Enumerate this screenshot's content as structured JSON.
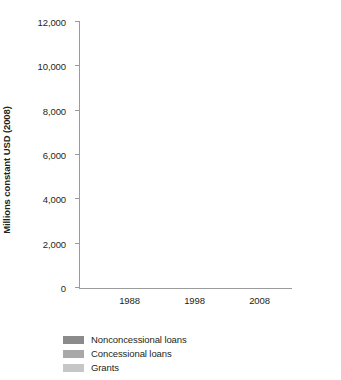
{
  "chart_data": {
    "type": "bar",
    "subtype": "stacked-vertical",
    "title": "",
    "xlabel": "",
    "ylabel": "Millions constant USD (2008)",
    "categories": [
      "1988",
      "1998",
      "2008"
    ],
    "ylim": [
      0,
      12000
    ],
    "yticks": [
      0,
      2000,
      4000,
      6000,
      8000,
      10000,
      12000
    ],
    "ytick_labels": [
      "0",
      "2,000",
      "4,000",
      "6,000",
      "8,000",
      "10,000",
      "12,000"
    ],
    "grid": false,
    "legend_position": "bottom-left",
    "series": [
      {
        "name": "Nonconcessional loans",
        "color": "#8b8b8b",
        "values": [
          700,
          500,
          600
        ]
      },
      {
        "name": "Concessional loans",
        "color": "#a8a8a8",
        "values": [
          700,
          650,
          0
        ]
      },
      {
        "name": "Grants",
        "color": "#c6c6c6",
        "values": [
          5970,
          5370,
          9650
        ]
      }
    ],
    "totals": [
      7370,
      6520,
      10250
    ]
  },
  "legend": {
    "items": [
      {
        "label": "Nonconcessional loans"
      },
      {
        "label": "Concessional loans"
      },
      {
        "label": "Grants"
      }
    ]
  },
  "colors": {
    "nonconcessional": "#8b8b8b",
    "concessional": "#a8a8a8",
    "grants": "#c6c6c6",
    "axis": "#9b9b9b",
    "text": "#231f20",
    "background": "#ffffff"
  }
}
